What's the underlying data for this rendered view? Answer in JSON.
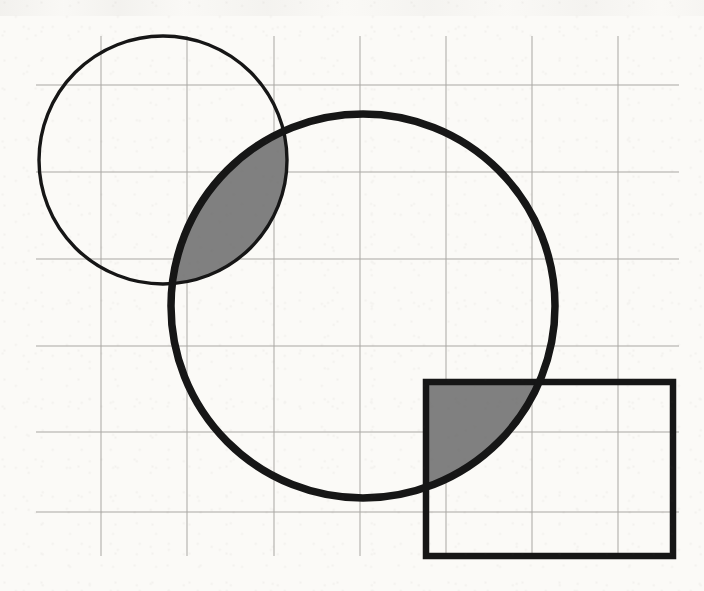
{
  "figure": {
    "background_color": "#fbfaf7",
    "canvas": {
      "width": 704,
      "height": 591
    }
  },
  "grid": {
    "name": "graph-paper-grid",
    "line_color": "#a9a7a3",
    "line_width": 1,
    "x_lines": [
      101,
      187,
      274,
      360,
      446,
      532,
      618
    ],
    "y_lines": [
      85,
      172,
      259,
      346,
      432,
      512
    ],
    "extent": {
      "left": 36,
      "right": 679,
      "top": 36,
      "bottom": 556
    },
    "spacing": 86
  },
  "shapes": {
    "small_circle": {
      "label": "Small circle",
      "cx": 163,
      "cy": 160,
      "r": 124,
      "stroke_color": "#161616",
      "stroke_width": 3.4,
      "fill": "none"
    },
    "large_circle": {
      "label": "Large circle",
      "cx": 363,
      "cy": 306,
      "r": 192,
      "stroke_color": "#161616",
      "stroke_width": 7.5,
      "fill": "none"
    },
    "rectangle": {
      "label": "Rectangle",
      "x": 426,
      "y": 382,
      "width": 247,
      "height": 174,
      "stroke_color": "#161616",
      "stroke_width": 6.5,
      "fill": "none"
    }
  },
  "shaded_regions": [
    {
      "name": "circle-circle-intersection",
      "label": "Lens of small circle and large circle",
      "fill_color": "#808080"
    },
    {
      "name": "circle-rectangle-intersection",
      "label": "Overlap of large circle and rectangle",
      "fill_color": "#808080"
    }
  ],
  "chart_data": {
    "type": "diagram",
    "elements": [
      {
        "kind": "circle",
        "name": "small_circle",
        "cx": 163,
        "cy": 160,
        "r": 124,
        "filled": false
      },
      {
        "kind": "circle",
        "name": "large_circle",
        "cx": 363,
        "cy": 306,
        "r": 192,
        "filled": false
      },
      {
        "kind": "rectangle",
        "name": "rectangle",
        "x": 426,
        "y": 382,
        "w": 247,
        "h": 174,
        "filled": false
      },
      {
        "kind": "intersection",
        "name": "small_circle_and_large_circle",
        "shaded": true
      },
      {
        "kind": "intersection",
        "name": "large_circle_and_rectangle",
        "shaded": true
      }
    ],
    "grid": {
      "spacing": 86,
      "x_lines": [
        101,
        187,
        274,
        360,
        446,
        532,
        618
      ],
      "y_lines": [
        85,
        172,
        259,
        346,
        432,
        512
      ]
    }
  }
}
